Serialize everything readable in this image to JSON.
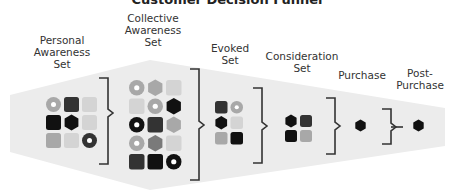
{
  "title": "Customer Decision Funnel",
  "colors": {
    "funnel_fill": "#ececec",
    "bracket": "#333333",
    "black": "#111111",
    "dark": "#333333",
    "mid": "#7a7a7a",
    "light": "#a8a8a8",
    "very_light": "#d4d4d4"
  },
  "stages": [
    {
      "id": "personal",
      "label": "Personal\nAwareness\nSet"
    },
    {
      "id": "collective",
      "label": "Collective\nAwareness\nSet"
    },
    {
      "id": "evoked",
      "label": "Evoked\nSet"
    },
    {
      "id": "consideration",
      "label": "Consideration\nSet"
    },
    {
      "id": "purchase",
      "label": "Purchase"
    },
    {
      "id": "post_purchase",
      "label": "Post-\nPurchase"
    }
  ],
  "grids": {
    "personal": [
      [
        "donut:light",
        "square:dark",
        "square:very_light"
      ],
      [
        "square:black",
        "hexagon:black",
        "square:very_light"
      ],
      [
        "square:light",
        "square:very_light",
        "donut:dark"
      ]
    ],
    "collective": [
      [
        "donut:light",
        "hexagon:light",
        "square:very_light"
      ],
      [
        "square:very_light",
        "donut:light",
        "hexagon:black"
      ],
      [
        "donut:black",
        "square:dark",
        "hexagon:light"
      ],
      [
        "donut:light",
        "hexagon:mid",
        "square:very_light"
      ],
      [
        "square:dark",
        "square:black",
        "donut:black"
      ]
    ],
    "evoked": [
      [
        "square:dark",
        "donut:light"
      ],
      [
        "hexagon:black",
        "square:very_light"
      ],
      [
        "square:light",
        "square:black"
      ]
    ],
    "consideration": [
      [
        "hexagon:black",
        "square:dark"
      ],
      [
        "square:black",
        "square:light"
      ]
    ],
    "purchase": [
      [
        "hexagon:black"
      ]
    ],
    "post_purchase": [
      [
        "hexagon:black"
      ]
    ]
  }
}
